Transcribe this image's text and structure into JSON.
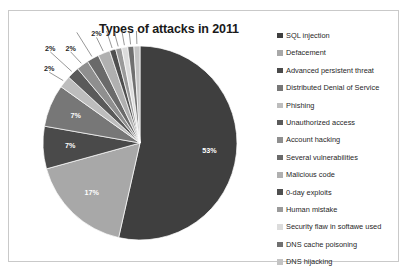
{
  "chart": {
    "title": "Types of attacks in 2011"
  },
  "chart_data": {
    "type": "pie",
    "title": "Types of attacks in 2011",
    "legend_position": "right",
    "value_suffix": "%",
    "categories": [
      "SQL injection",
      "Defacement",
      "Advanced persistent threat",
      "Distributed Denial of Service",
      "Phishing",
      "Unauthorized access",
      "Account hacking",
      "Several vulnerabilities",
      "Malicious code",
      "0-day exploits",
      "Human mistake",
      "Security flaw in softawe used",
      "DNS cache poisoning",
      "DNS hijacking"
    ],
    "values": [
      53,
      17,
      7,
      7,
      2,
      2,
      2,
      2,
      2,
      1,
      1,
      1,
      1,
      1
    ],
    "labels": [
      "53%",
      "17%",
      "7%",
      "7%",
      "2%",
      "2%",
      "2%",
      "2%",
      "2%",
      "1%",
      "1%",
      "1%",
      "1%",
      "1%"
    ],
    "colors": [
      "#3f3f3f",
      "#a8a8a8",
      "#4a4a4a",
      "#777777",
      "#bdbdbd",
      "#5a5a5a",
      "#8f8f8f",
      "#6a6a6a",
      "#b0b0b0",
      "#4f4f4f",
      "#9a9a9a",
      "#dcdcdc",
      "#707070",
      "#c4c4c4"
    ]
  }
}
